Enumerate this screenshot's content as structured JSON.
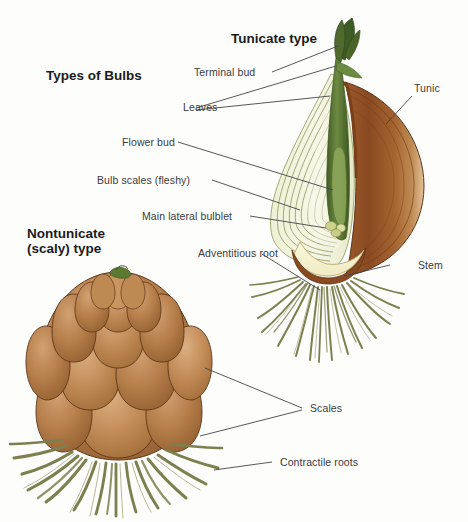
{
  "figure": {
    "background_color": "#fdfdfc",
    "main_title": "Types of Bulbs",
    "section_titles": {
      "tunicate": "Tunicate type",
      "nontunicate_line1": "Nontunicate",
      "nontunicate_line2": "(scaly) type"
    }
  },
  "labels": {
    "terminal_bud": "Terminal bud",
    "leaves": "Leaves",
    "flower_bud": "Flower bud",
    "bulb_scales": "Bulb scales (fleshy)",
    "main_lateral_bulblet": "Main lateral bulblet",
    "adventitious_root": "Adventitious root",
    "tunic": "Tunic",
    "stem": "Stem",
    "scales": "Scales",
    "contractile_roots": "Contractile roots"
  },
  "colors": {
    "tunic_brown": "#8B4A22",
    "tunic_brown_dark": "#6d3516",
    "scale_cream": "#f2f3dc",
    "scale_outline": "#9aa06a",
    "shoot_green": "#5d7a35",
    "leaf_green_dark": "#3f5b24",
    "basal_plate": "#f6f2cf",
    "root_olive": "#7c7f4e",
    "scaly_bulb_brown": "#a9713f",
    "scaly_bulb_light": "#c59161",
    "scaly_outline": "#5d3518",
    "leader_line": "#44444a",
    "text": "#3b3b3b",
    "title_text": "#1b1b1b"
  }
}
